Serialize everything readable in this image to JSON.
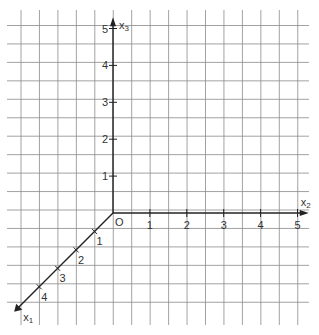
{
  "figure": {
    "type": "3d-coordinate-system-on-grid",
    "colors": {
      "grid": "#8a8a8a",
      "axis": "#222222",
      "text": "#333333",
      "background": "#ffffff"
    },
    "grid": {
      "x0": 21,
      "x1": 297,
      "y0": 7,
      "y1": 325,
      "spacing": 18.45,
      "v_start": 21,
      "v_count": 16,
      "h_start": 25.5,
      "h_count": 16
    },
    "origin": {
      "x": 113,
      "y": 213,
      "label": "O"
    },
    "axes": {
      "x1": {
        "label": "x",
        "subscript": "1",
        "ticks": [
          "1",
          "2",
          "3",
          "4"
        ]
      },
      "x2": {
        "label": "x",
        "subscript": "2",
        "ticks": [
          "1",
          "2",
          "3",
          "4",
          "5"
        ]
      },
      "x3": {
        "label": "x",
        "subscript": "3",
        "ticks": [
          "1",
          "2",
          "3",
          "4",
          "5"
        ]
      }
    }
  }
}
